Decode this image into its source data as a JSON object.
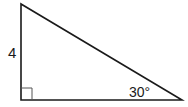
{
  "figure": {
    "type": "right-triangle",
    "side_label": "4",
    "angle_label": "30°",
    "right_angle_marker": true,
    "vertices": {
      "top": [
        21,
        4
      ],
      "bottom_left": [
        21,
        100
      ],
      "bottom_right": [
        182,
        100
      ]
    },
    "colors": {
      "stroke": "#1a1a1a",
      "marker": "#555555",
      "background": "#ffffff"
    }
  }
}
